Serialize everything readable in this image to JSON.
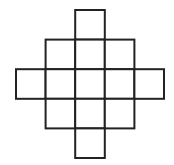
{
  "diagram": {
    "row_counts": [
      1,
      3,
      5,
      3,
      1
    ],
    "total_squares": 13,
    "cell_size": 29.6,
    "origin": {
      "x": 16,
      "y": 10
    },
    "stroke_color": "#222222",
    "stroke_width": 2,
    "fill_color": "#ffffff",
    "cells": [
      {
        "row": 0,
        "col": 2
      },
      {
        "row": 1,
        "col": 1
      },
      {
        "row": 1,
        "col": 2
      },
      {
        "row": 1,
        "col": 3
      },
      {
        "row": 2,
        "col": 0
      },
      {
        "row": 2,
        "col": 1
      },
      {
        "row": 2,
        "col": 2
      },
      {
        "row": 2,
        "col": 3
      },
      {
        "row": 2,
        "col": 4
      },
      {
        "row": 3,
        "col": 1
      },
      {
        "row": 3,
        "col": 2
      },
      {
        "row": 3,
        "col": 3
      },
      {
        "row": 4,
        "col": 2
      }
    ]
  }
}
